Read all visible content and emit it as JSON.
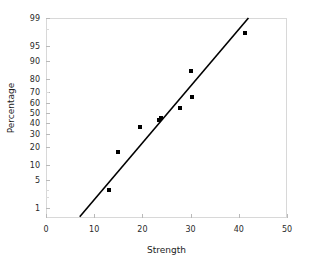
{
  "chart_data": {
    "type": "scatter",
    "title": "",
    "xlabel": "Strength",
    "ylabel": "Percentage",
    "xlim": [
      0,
      50
    ],
    "ylim": [
      0.5,
      99
    ],
    "y_scale": "probit",
    "grid": false,
    "legend": null,
    "xticks": [
      0,
      10,
      20,
      30,
      40,
      50
    ],
    "xtick_labels": [
      "0",
      "10",
      "20",
      "30",
      "40",
      "50"
    ],
    "yticks": [
      1,
      5,
      10,
      20,
      30,
      40,
      50,
      60,
      70,
      80,
      90,
      95,
      99
    ],
    "ytick_labels": [
      "1",
      "5",
      "10",
      "20",
      "30",
      "40",
      "50",
      "60",
      "70",
      "80",
      "90",
      "95",
      "99"
    ],
    "points": [
      {
        "x": 13.0,
        "y": 3.0
      },
      {
        "x": 15.0,
        "y": 17.0
      },
      {
        "x": 19.5,
        "y": 36.5
      },
      {
        "x": 23.4,
        "y": 43.0
      },
      {
        "x": 23.8,
        "y": 45.0
      },
      {
        "x": 27.8,
        "y": 55.0
      },
      {
        "x": 30.2,
        "y": 65.5
      },
      {
        "x": 30.0,
        "y": 84.5
      },
      {
        "x": 41.2,
        "y": 97.5
      }
    ],
    "fit_line": {
      "x_start": 7.0,
      "y_start": 0.55,
      "x_end": 42.0,
      "y_end": 99.0,
      "color": "#000000"
    },
    "marker_color": "#000000",
    "frame_color": "#d8d8d8"
  }
}
